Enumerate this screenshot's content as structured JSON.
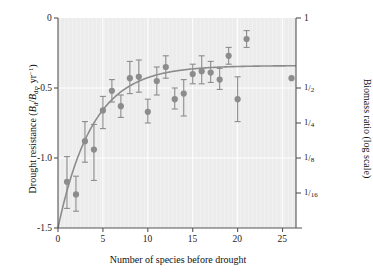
{
  "chart_data": {
    "type": "scatter",
    "title": "",
    "xlabel": "Number of species before drought",
    "ylabel": "Drought resistance (B_d / B_dr, yr^-1)",
    "ylabel_right": "Biomass ratio (log scale)",
    "xlim": [
      0,
      26.5
    ],
    "ylim": [
      -1.5,
      0
    ],
    "xticks": [
      0,
      5,
      10,
      15,
      20,
      25
    ],
    "xticklabels": [
      "0",
      "5",
      "10",
      "15",
      "20",
      "25"
    ],
    "yticks": [
      0,
      -0.5,
      -1.0,
      -1.5
    ],
    "yticklabels": [
      "0",
      "-0.5",
      "-1.0",
      "-1.5"
    ],
    "y2ticks": [
      0,
      -0.5,
      -1.0,
      -1.5
    ],
    "y2ticklabels": [
      "1",
      "1/2",
      "1/4",
      "1/8",
      "1/16"
    ],
    "y2tickvalues": [
      0,
      -0.5,
      -0.75,
      -1.0,
      -1.25
    ],
    "grid": true,
    "legend": "none",
    "marker_color": "#8c8c8c",
    "line_color": "#8c8c8c",
    "plot_background": "#ececec",
    "gridline_color": "#ffffff",
    "axis_color": "#555555",
    "points": [
      {
        "x": 1,
        "y": -1.17,
        "lo": -1.36,
        "hi": -0.99
      },
      {
        "x": 2,
        "y": -1.26,
        "lo": -1.38,
        "hi": -1.13
      },
      {
        "x": 3,
        "y": -0.88,
        "lo": -1.03,
        "hi": -0.74
      },
      {
        "x": 4,
        "y": -0.94,
        "lo": -1.16,
        "hi": -0.76
      },
      {
        "x": 5,
        "y": -0.66,
        "lo": -0.79,
        "hi": -0.56
      },
      {
        "x": 6,
        "y": -0.52,
        "lo": -0.6,
        "hi": -0.44
      },
      {
        "x": 7,
        "y": -0.63,
        "lo": -0.71,
        "hi": -0.55
      },
      {
        "x": 8,
        "y": -0.43,
        "lo": -0.54,
        "hi": -0.31
      },
      {
        "x": 9,
        "y": -0.42,
        "lo": -0.53,
        "hi": -0.3
      },
      {
        "x": 10,
        "y": -0.67,
        "lo": -0.75,
        "hi": -0.58
      },
      {
        "x": 11,
        "y": -0.45,
        "lo": -0.55,
        "hi": -0.35
      },
      {
        "x": 12,
        "y": -0.35,
        "lo": -0.43,
        "hi": -0.27
      },
      {
        "x": 13,
        "y": -0.58,
        "lo": -0.65,
        "hi": -0.5
      },
      {
        "x": 14,
        "y": -0.54,
        "lo": -0.7,
        "hi": -0.44
      },
      {
        "x": 15,
        "y": -0.4,
        "lo": -0.47,
        "hi": -0.33
      },
      {
        "x": 16,
        "y": -0.38,
        "lo": -0.47,
        "hi": -0.27
      },
      {
        "x": 17,
        "y": -0.39,
        "lo": -0.46,
        "hi": -0.31
      },
      {
        "x": 18,
        "y": -0.44,
        "lo": -0.51,
        "hi": -0.36
      },
      {
        "x": 19,
        "y": -0.27,
        "lo": -0.33,
        "hi": -0.21
      },
      {
        "x": 20,
        "y": -0.58,
        "lo": -0.74,
        "hi": -0.42
      },
      {
        "x": 21,
        "y": -0.15,
        "lo": -0.21,
        "hi": -0.09
      },
      {
        "x": 26,
        "y": -0.43,
        "lo": -0.43,
        "hi": -0.43
      }
    ],
    "fit_curve": {
      "description": "saturating exponential fit",
      "asymptote": -0.34,
      "amplitude": -1.16,
      "rate": 0.26,
      "equation": "y = -0.34 - 1.16 * exp(-0.26 x)"
    }
  },
  "axes": {
    "left_title_parts": {
      "pre": "Drought resistance (",
      "b1": "B",
      "sub1": "d",
      "slash": "/",
      "b2": "B",
      "sub2": "dr",
      "comma": ", yr",
      "sup": "−1",
      "post": ")"
    },
    "right_title": "Biomass ratio (log scale)",
    "x_title": "Number of species before drought"
  }
}
